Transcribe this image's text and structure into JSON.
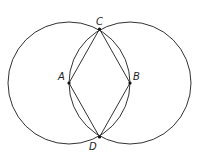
{
  "diagram": {
    "type": "geometric construction",
    "colors": {
      "stroke": "#333333",
      "point": "#111111",
      "background": "#ffffff"
    },
    "points": {
      "A": {
        "label": "A",
        "x": 69,
        "y": 83
      },
      "B": {
        "label": "B",
        "x": 130,
        "y": 83
      },
      "C": {
        "label": "C",
        "x": 99.5,
        "y": 29
      },
      "D": {
        "label": "D",
        "x": 99.5,
        "y": 137
      }
    },
    "circles": [
      {
        "center": "A",
        "radius": 61
      },
      {
        "center": "B",
        "radius": 61
      }
    ],
    "segments": [
      "AC",
      "CB",
      "BD",
      "DA"
    ]
  }
}
